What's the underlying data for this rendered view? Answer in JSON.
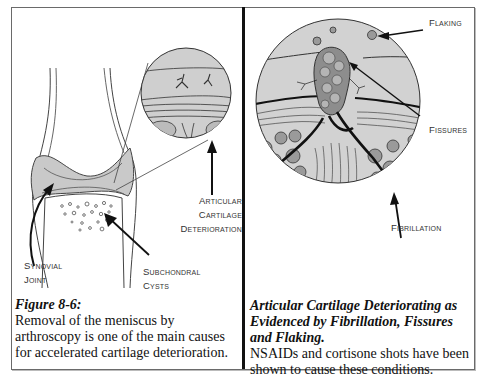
{
  "left_panel": {
    "labels": {
      "articular_line1": "Articular",
      "articular_line2": "Cartilage",
      "articular_line3": "Deterioration",
      "synovial_line1": "Synovial",
      "synovial_line2": "Joint",
      "subchondral_line1": "Subchondral",
      "subchondral_line2": "Cysts"
    },
    "caption": {
      "title": "Figure 8-6:",
      "body": "Removal of the meniscus by arthroscopy is one of the main causes for accelerated cartilage deterioration."
    }
  },
  "right_panel": {
    "labels": {
      "flaking": "Flaking",
      "fissures": "Fissures",
      "fibrillation": "Fibrillation"
    },
    "caption": {
      "title": "Articular Cartilage Deteriorating as Evidenced by Fibrillation, Fissures and Flaking.",
      "body": "NSAIDs and cortisone shots have been shown to cause these conditions."
    }
  },
  "colors": {
    "cartilage_fill": "#c9c9c9",
    "line": "#222222",
    "border": "#6a6a6a"
  }
}
